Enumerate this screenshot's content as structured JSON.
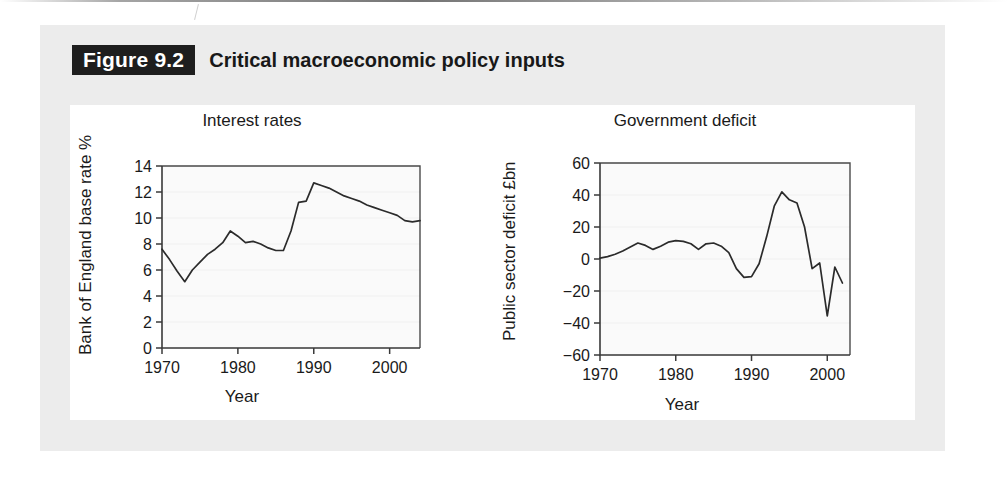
{
  "figure": {
    "badge": "Figure 9.2",
    "caption": "Critical macroeconomic policy inputs"
  },
  "colors": {
    "card_background": "#ececec",
    "panel_background": "#ffffff",
    "badge_background": "#1e1e1e",
    "badge_text": "#ffffff",
    "line": "#2b2b2b",
    "axis": "#3a3a3a",
    "plot_background": "#fafafa"
  },
  "chart_data": [
    {
      "id": "interest-rates",
      "type": "line",
      "title": "Interest rates",
      "xlabel": "Year",
      "ylabel": "Bank of England base rate %",
      "xlim": [
        1970,
        2004
      ],
      "ylim": [
        0,
        14
      ],
      "xticks": [
        1970,
        1980,
        1990,
        2000
      ],
      "yticks": [
        0,
        2,
        4,
        6,
        8,
        10,
        12,
        14
      ],
      "grid": false,
      "legend": "none",
      "series": [
        {
          "name": "Bank of England base rate",
          "x": [
            1970,
            1971,
            1972,
            1973,
            1974,
            1975,
            1976,
            1977,
            1978,
            1979,
            1980,
            1981,
            1982,
            1983,
            1984,
            1985,
            1986,
            1987,
            1988,
            1989,
            1990,
            1991,
            1992,
            1993,
            1994,
            1995,
            1996,
            1997,
            1998,
            1999,
            2000,
            2001,
            2002,
            2003,
            2004
          ],
          "y": [
            7.6,
            6.8,
            5.9,
            5.1,
            6.0,
            6.6,
            7.2,
            7.6,
            8.1,
            9.0,
            8.6,
            8.1,
            8.2,
            8.0,
            7.7,
            7.5,
            7.5,
            9.0,
            11.2,
            11.3,
            12.7,
            12.5,
            12.3,
            12.0,
            11.7,
            11.5,
            11.3,
            11.0,
            10.8,
            10.6,
            10.4,
            10.2,
            9.8,
            9.7,
            9.8
          ]
        }
      ]
    },
    {
      "id": "government-deficit",
      "type": "line",
      "title": "Government deficit",
      "xlabel": "Year",
      "ylabel": "Public sector deficit £bn",
      "xlim": [
        1970,
        2003
      ],
      "ylim": [
        -60,
        60
      ],
      "xticks": [
        1970,
        1980,
        1990,
        2000
      ],
      "yticks": [
        -60,
        -40,
        -20,
        0,
        20,
        40,
        60
      ],
      "grid": false,
      "legend": "none",
      "series": [
        {
          "name": "Public sector deficit",
          "x": [
            1970,
            1971,
            1972,
            1973,
            1974,
            1975,
            1976,
            1977,
            1978,
            1979,
            1980,
            1981,
            1982,
            1983,
            1984,
            1985,
            1986,
            1987,
            1988,
            1989,
            1990,
            1991,
            1992,
            1993,
            1994,
            1995,
            1996,
            1997,
            1998,
            1999,
            2000,
            2001,
            2002
          ],
          "y": [
            0.5,
            1.5,
            3.0,
            5.0,
            7.5,
            10.0,
            8.5,
            6.0,
            8.0,
            10.5,
            11.5,
            11.0,
            9.5,
            6.0,
            9.5,
            10.0,
            8.0,
            4.0,
            -6.0,
            -11.5,
            -11.0,
            -3.0,
            14.0,
            33.0,
            42.0,
            37.0,
            35.0,
            20.0,
            -6.0,
            -2.5,
            -35.5,
            -5.0,
            -15.0
          ]
        }
      ]
    }
  ]
}
